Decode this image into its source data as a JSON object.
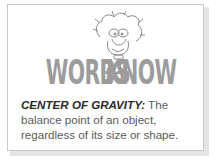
{
  "card": {
    "title_word1": "WORDS",
    "title_word2": "to",
    "title_word3": "KNOW",
    "mascot": "cartoon-character-icon",
    "term": "CENTER OF GRAVITY:",
    "definition": " The balance point of an object, regardless of its size or shape."
  },
  "colors": {
    "title": "#9c9c9c",
    "term": "#2a2a2a",
    "definition": "#5a5a5a",
    "border": "#c8c8c8"
  }
}
